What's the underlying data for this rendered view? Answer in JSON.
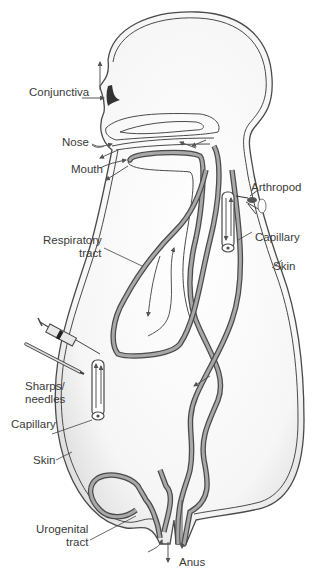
{
  "diagram": {
    "colors": {
      "background": "#ffffff",
      "outline": "#4a4a4a",
      "tract_fill": "#a8a8a8",
      "body_fill": "#f3f3f3",
      "conjunctiva": "#333333",
      "label_text": "#3a3a3a",
      "arrow": "#555555"
    },
    "labels": {
      "conjunctiva": "Conjunctiva",
      "nose": "Nose",
      "mouth": "Mouth",
      "arthropod": "Arthropod",
      "capillary_right": "Capillary",
      "skin_right": "Skin",
      "respiratory_line1": "Respiratory",
      "respiratory_line2": "tract",
      "sharps_line1": "Sharps/",
      "sharps_line2": "needles",
      "capillary_left": "Capillary",
      "skin_left": "Skin",
      "urogenital_line1": "Urogenital",
      "urogenital_line2": "tract",
      "anus": "Anus"
    },
    "icons": {
      "syringe": "syringe-icon",
      "needle": "needle-icon",
      "arthropod": "mosquito-icon"
    }
  }
}
